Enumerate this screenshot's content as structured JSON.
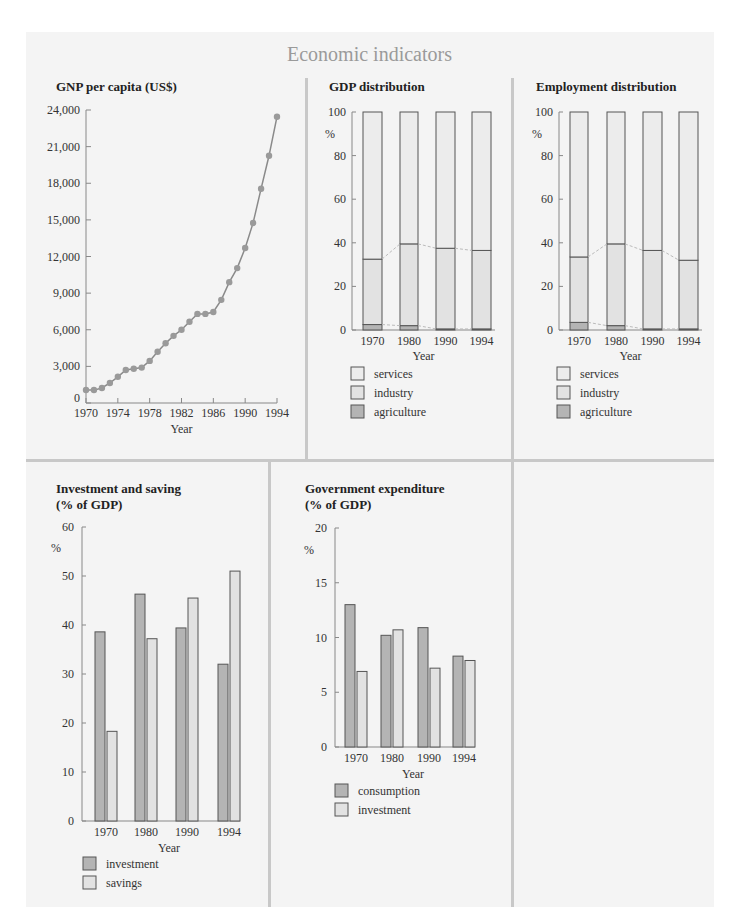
{
  "page": {
    "title": "Economic indicators",
    "background_color": "#f4f4f4",
    "title_color": "#9a9a9a"
  },
  "colors": {
    "dark_bar": "#b4b4b4",
    "light_bar": "#e2e2e2",
    "lighter_bar": "#ececec",
    "line": "#8a8a8a",
    "marker": "#9a9a9a",
    "axis": "#888888",
    "outline": "#555555",
    "dash": "#bbbbbb"
  },
  "chart_data": [
    {
      "id": "gnp",
      "type": "line",
      "title": "GNP per capita (US$)",
      "xlabel": "Year",
      "ylabel": "",
      "x": [
        1970,
        1971,
        1972,
        1973,
        1974,
        1975,
        1976,
        1977,
        1978,
        1979,
        1980,
        1981,
        1982,
        1983,
        1984,
        1985,
        1986,
        1987,
        1988,
        1989,
        1990,
        1991,
        1992,
        1993,
        1994
      ],
      "values": [
        1070,
        1060,
        1230,
        1640,
        2150,
        2700,
        2800,
        2900,
        3450,
        4200,
        4900,
        5500,
        6000,
        6650,
        7300,
        7300,
        7450,
        8450,
        9900,
        11050,
        12700,
        14750,
        17550,
        20250,
        23450
      ],
      "ylim": [
        0,
        24000
      ],
      "yticks": [
        0,
        3000,
        6000,
        9000,
        12000,
        15000,
        18000,
        21000,
        24000
      ],
      "ytick_labels": [
        "0",
        "3,000",
        "6,000",
        "9,000",
        "12,000",
        "15,000",
        "18,000",
        "21,000",
        "24,000"
      ],
      "xticks": [
        1970,
        1974,
        1978,
        1982,
        1986,
        1990,
        1994
      ],
      "xtick_labels": [
        "1970",
        "1974",
        "1978",
        "1982",
        "1986",
        "1990",
        "1994"
      ],
      "grid": false
    },
    {
      "id": "gdp",
      "type": "bar",
      "stacked": true,
      "title": "GDP distribution",
      "xlabel": "Year",
      "ylabel": "%",
      "categories": [
        "1970",
        "1980",
        "1990",
        "1994"
      ],
      "series": [
        {
          "name": "agriculture",
          "values": [
            2.5,
            2.0,
            0.5,
            0.5
          ]
        },
        {
          "name": "industry",
          "values": [
            30.0,
            37.5,
            37.0,
            36.0
          ]
        },
        {
          "name": "services",
          "values": [
            67.5,
            60.5,
            62.5,
            63.5
          ]
        }
      ],
      "ylim": [
        0,
        100
      ],
      "yticks": [
        0,
        20,
        40,
        60,
        80,
        100
      ],
      "legend": [
        "services",
        "industry",
        "agriculture"
      ],
      "legend_position": "bottom"
    },
    {
      "id": "employment",
      "type": "bar",
      "stacked": true,
      "title": "Employment distribution",
      "xlabel": "Year",
      "ylabel": "%",
      "categories": [
        "1970",
        "1980",
        "1990",
        "1994"
      ],
      "series": [
        {
          "name": "agriculture",
          "values": [
            3.5,
            2.0,
            0.5,
            0.5
          ]
        },
        {
          "name": "industry",
          "values": [
            30.0,
            37.5,
            36.0,
            31.5
          ]
        },
        {
          "name": "services",
          "values": [
            66.5,
            60.5,
            63.5,
            68.0
          ]
        }
      ],
      "ylim": [
        0,
        100
      ],
      "yticks": [
        0,
        20,
        40,
        60,
        80,
        100
      ],
      "legend": [
        "services",
        "industry",
        "agriculture"
      ],
      "legend_position": "bottom"
    },
    {
      "id": "investment",
      "type": "bar",
      "stacked": false,
      "title": "Investment and saving",
      "subtitle": "(% of GDP)",
      "xlabel": "Year",
      "ylabel": "%",
      "categories": [
        "1970",
        "1980",
        "1990",
        "1994"
      ],
      "series": [
        {
          "name": "investment",
          "values": [
            38.6,
            46.3,
            39.4,
            32.0
          ]
        },
        {
          "name": "savings",
          "values": [
            18.3,
            37.2,
            45.5,
            51.0
          ]
        }
      ],
      "ylim": [
        0,
        60
      ],
      "yticks": [
        0,
        10,
        20,
        30,
        40,
        50,
        60
      ],
      "legend": [
        "investment",
        "savings"
      ],
      "legend_position": "bottom"
    },
    {
      "id": "government",
      "type": "bar",
      "stacked": false,
      "title": "Government expenditure",
      "subtitle": "(% of GDP)",
      "xlabel": "Year",
      "ylabel": "%",
      "categories": [
        "1970",
        "1980",
        "1990",
        "1994"
      ],
      "series": [
        {
          "name": "consumption",
          "values": [
            13.0,
            10.2,
            10.9,
            8.3
          ]
        },
        {
          "name": "investment",
          "values": [
            6.9,
            10.7,
            7.2,
            7.9
          ]
        }
      ],
      "ylim": [
        0,
        20
      ],
      "yticks": [
        0,
        5,
        10,
        15,
        20
      ],
      "legend": [
        "consumption",
        "investment"
      ],
      "legend_position": "bottom"
    }
  ]
}
